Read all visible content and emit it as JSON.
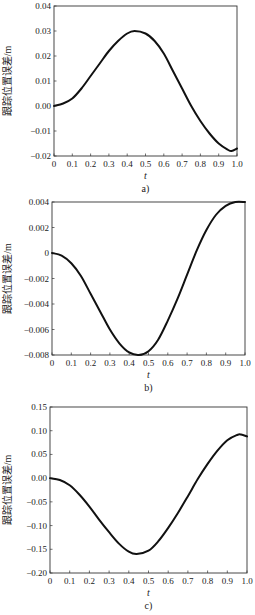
{
  "chart_data": [
    {
      "type": "line",
      "panel_label": "a)",
      "title": "",
      "xlabel": "t",
      "ylabel": "跟踪位置误差/m",
      "xlim": [
        0,
        1.0
      ],
      "ylim": [
        -0.02,
        0.04
      ],
      "x_ticks": [
        0,
        0.1,
        0.2,
        0.3,
        0.4,
        0.5,
        0.6,
        0.7,
        0.8,
        0.9,
        1.0
      ],
      "x_tick_labels": [
        "0",
        "0.1",
        "0.2",
        "0.3",
        "0.4",
        "0.5",
        "0.6",
        "0.7",
        "0.8",
        "0.9",
        "1.0"
      ],
      "y_ticks": [
        -0.02,
        -0.01,
        0.0,
        0.01,
        0.02,
        0.03,
        0.04
      ],
      "y_tick_labels": [
        "−0.02",
        "−0.01",
        "0.00",
        "0.01",
        "0.02",
        "0.03",
        "0.04"
      ],
      "grid": false,
      "legend": null,
      "frame": {
        "left": 54,
        "top": 6,
        "right": 237,
        "bottom": 156
      },
      "series": [
        {
          "name": "tracking error",
          "x": [
            0,
            0.05,
            0.1,
            0.15,
            0.2,
            0.25,
            0.3,
            0.35,
            0.4,
            0.44,
            0.5,
            0.55,
            0.6,
            0.65,
            0.7,
            0.75,
            0.8,
            0.85,
            0.9,
            0.95,
            0.97,
            1.0
          ],
          "y": [
            0.0,
            0.001,
            0.003,
            0.007,
            0.012,
            0.017,
            0.022,
            0.026,
            0.029,
            0.03,
            0.029,
            0.026,
            0.021,
            0.014,
            0.007,
            0.0,
            -0.006,
            -0.011,
            -0.015,
            -0.0175,
            -0.018,
            -0.017
          ]
        }
      ]
    },
    {
      "type": "line",
      "panel_label": "b)",
      "title": "",
      "xlabel": "t",
      "ylabel": "跟踪位置误差/m",
      "xlim": [
        0,
        1.0
      ],
      "ylim": [
        -0.008,
        0.004
      ],
      "x_ticks": [
        0,
        0.1,
        0.2,
        0.3,
        0.4,
        0.5,
        0.6,
        0.7,
        0.8,
        0.9,
        1.0
      ],
      "x_tick_labels": [
        "0",
        "0.1",
        "0.2",
        "0.3",
        "0.4",
        "0.5",
        "0.6",
        "0.7",
        "0.8",
        "0.9",
        "1.0"
      ],
      "y_ticks": [
        -0.008,
        -0.006,
        -0.004,
        -0.002,
        0,
        0.002,
        0.004
      ],
      "y_tick_labels": [
        "−0.008",
        "−0.006",
        "−0.004",
        "−0.002",
        "0",
        "0.002",
        "0.004"
      ],
      "grid": false,
      "legend": null,
      "frame": {
        "left": 52,
        "top": 202,
        "right": 245,
        "bottom": 355
      },
      "series": [
        {
          "name": "tracking error",
          "x": [
            0,
            0.05,
            0.1,
            0.15,
            0.2,
            0.25,
            0.3,
            0.35,
            0.4,
            0.45,
            0.5,
            0.55,
            0.6,
            0.65,
            0.7,
            0.75,
            0.8,
            0.85,
            0.9,
            0.95,
            1.0
          ],
          "y": [
            0.0,
            -0.0002,
            -0.0008,
            -0.0018,
            -0.0032,
            -0.0046,
            -0.006,
            -0.0071,
            -0.0078,
            -0.008,
            -0.0077,
            -0.0068,
            -0.0053,
            -0.0036,
            -0.0017,
            0.0002,
            0.0018,
            0.003,
            0.0037,
            0.004,
            0.004
          ]
        }
      ]
    },
    {
      "type": "line",
      "panel_label": "c)",
      "title": "",
      "xlabel": "t",
      "ylabel": "跟踪位置误差/m",
      "xlim": [
        0,
        1.0
      ],
      "ylim": [
        -0.2,
        0.15
      ],
      "x_ticks": [
        0,
        0.1,
        0.2,
        0.3,
        0.4,
        0.5,
        0.6,
        0.7,
        0.8,
        0.9,
        1.0
      ],
      "x_tick_labels": [
        "0",
        "0.1",
        "0.2",
        "0.3",
        "0.4",
        "0.5",
        "0.6",
        "0.7",
        "0.8",
        "0.9",
        "1.0"
      ],
      "y_ticks": [
        -0.2,
        -0.15,
        -0.1,
        -0.05,
        0.0,
        0.05,
        0.1,
        0.15
      ],
      "y_tick_labels": [
        "−0.20",
        "−0.15",
        "−0.10",
        "−0.05",
        "0.00",
        "0.05",
        "0.10",
        "0.15"
      ],
      "grid": false,
      "legend": null,
      "frame": {
        "left": 50,
        "top": 407,
        "right": 247,
        "bottom": 573
      },
      "series": [
        {
          "name": "tracking error",
          "x": [
            0,
            0.05,
            0.1,
            0.15,
            0.2,
            0.25,
            0.3,
            0.35,
            0.4,
            0.44,
            0.5,
            0.55,
            0.6,
            0.65,
            0.7,
            0.75,
            0.8,
            0.85,
            0.9,
            0.95,
            0.97,
            1.0
          ],
          "y": [
            0.0,
            -0.004,
            -0.015,
            -0.035,
            -0.06,
            -0.088,
            -0.114,
            -0.138,
            -0.155,
            -0.16,
            -0.153,
            -0.133,
            -0.105,
            -0.073,
            -0.038,
            -0.002,
            0.03,
            0.058,
            0.08,
            0.091,
            0.092,
            0.088
          ]
        }
      ]
    }
  ]
}
